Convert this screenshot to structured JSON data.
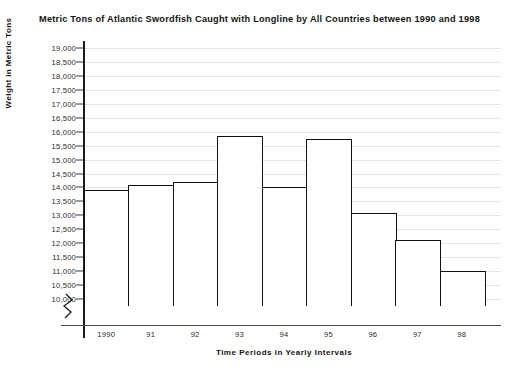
{
  "chart_data": {
    "type": "bar",
    "title": "Metric Tons of Atlantic Swordfish Caught with Longline by All Countries between 1990 and 1998",
    "xlabel": "Time Periods in Yearly Intervals",
    "ylabel": "Weight in Metric Tons",
    "categories": [
      "1990",
      "91",
      "92",
      "93",
      "94",
      "95",
      "96",
      "97",
      "98"
    ],
    "values": [
      13900,
      14100,
      14200,
      15850,
      14000,
      15750,
      13100,
      12100,
      11000
    ],
    "ylim": [
      9750,
      19250
    ],
    "ytick_values": [
      19000,
      18500,
      18000,
      17500,
      17000,
      16500,
      16000,
      15500,
      15000,
      14500,
      14000,
      13500,
      13000,
      12500,
      12000,
      11500,
      11000,
      10500,
      10000
    ],
    "ytick_labels": [
      "19,000",
      "18,500",
      "18,000",
      "17,500",
      "17,000",
      "16,500",
      "16,000",
      "15,500",
      "15,000",
      "14,500",
      "14,000",
      "13,500",
      "13,000",
      "12,500",
      "12,000",
      "11,500",
      "11,000",
      "10,500",
      "10,000"
    ],
    "grid": true,
    "legend": null,
    "axis_break": true,
    "axis_break_note": "y-axis broken below 10,000",
    "bar_fill_color": "#ffffff",
    "bar_edge_color": "#111111",
    "grid_color": "#e6e6e6",
    "axis_color": "#1a1a1a",
    "text_color": "#141414"
  }
}
